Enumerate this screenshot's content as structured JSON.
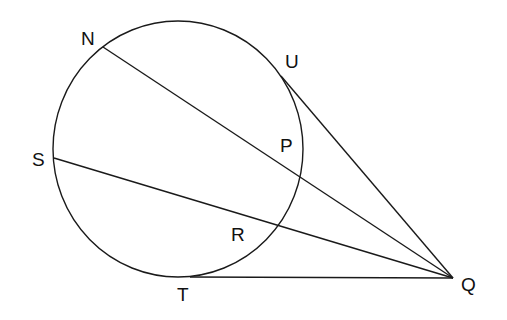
{
  "diagram": {
    "stroke_color": "#1a1a1a",
    "labels": {
      "N": "N",
      "U": "U",
      "P": "P",
      "S": "S",
      "R": "R",
      "T": "T",
      "Q": "Q"
    },
    "segments": [
      {
        "from": "N",
        "to": "Q",
        "type": "secant",
        "passes_through": "P"
      },
      {
        "from": "S",
        "to": "Q",
        "type": "secant",
        "passes_through": "R"
      },
      {
        "from": "U",
        "to": "Q",
        "type": "tangent"
      },
      {
        "from": "T",
        "to": "Q",
        "type": "tangent"
      }
    ]
  }
}
